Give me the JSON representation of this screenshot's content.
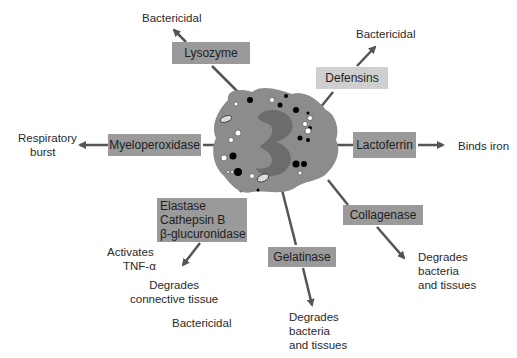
{
  "diagram": {
    "center": "Neutrophil (granulocyte)",
    "enzymes": {
      "lysozyme": {
        "name": "Lysozyme",
        "effect": "Bactericidal"
      },
      "defensins": {
        "name": "Defensins",
        "effect": "Bactericidal"
      },
      "myeloperoxidase": {
        "name": "Myeloperoxidase",
        "effect_line1": "Respiratory",
        "effect_line2": "burst"
      },
      "lactoferrin": {
        "name": "Lactoferrin",
        "effect": "Binds iron"
      },
      "elastase_group": {
        "line1": "Elastase",
        "line2": "Cathepsin B",
        "line3": "β-glucuronidase",
        "effect1_line1": "Activates",
        "effect1_line2": "TNF-α",
        "effect2_line1": "Degrades",
        "effect2_line2": "connective tissue",
        "effect3": "Bactericidal"
      },
      "gelatinase": {
        "name": "Gelatinase",
        "effect_line1": "Degrades",
        "effect_line2": "bacteria",
        "effect_line3": "and tissues"
      },
      "collagenase": {
        "name": "Collagenase",
        "effect_line1": "Degrades",
        "effect_line2": "bacteria",
        "effect_line3": "and tissues"
      }
    }
  }
}
